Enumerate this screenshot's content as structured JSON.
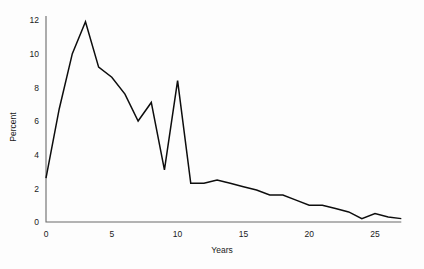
{
  "chart_data": {
    "type": "line",
    "title": "",
    "xlabel": "Years",
    "ylabel": "Percent",
    "xlim": [
      0,
      27
    ],
    "ylim": [
      0,
      12.6
    ],
    "grid": false,
    "legend": false,
    "legend_position": "none",
    "x_ticks": [
      0,
      5,
      10,
      15,
      20,
      25
    ],
    "x_tick_labels": [
      "0",
      "5",
      "10",
      "15",
      "20",
      "25"
    ],
    "y_ticks": [
      0,
      2,
      4,
      6,
      8,
      10,
      12
    ],
    "y_tick_labels": [
      "0",
      "2",
      "4",
      "6",
      "8",
      "10",
      "12"
    ],
    "line_color": "#0d0d0d",
    "axis_color": "#6b6b6b",
    "background_color": "#fdfdfd",
    "x": [
      0,
      1,
      2,
      3,
      4,
      5,
      6,
      7,
      8,
      9,
      10,
      11,
      12,
      13,
      14,
      15,
      16,
      17,
      18,
      19,
      20,
      21,
      22,
      23,
      24,
      25,
      26,
      27
    ],
    "values": [
      2.6,
      6.7,
      10.0,
      11.9,
      9.2,
      8.6,
      7.6,
      6.0,
      7.1,
      3.1,
      8.4,
      2.3,
      2.3,
      2.5,
      2.3,
      2.1,
      1.9,
      1.6,
      1.6,
      1.3,
      1.0,
      1.0,
      0.8,
      0.6,
      0.2,
      0.5,
      0.3,
      0.2
    ],
    "series": [
      {
        "name": "Percent",
        "values": [
          2.6,
          6.7,
          10.0,
          11.9,
          9.2,
          8.6,
          7.6,
          6.0,
          7.1,
          3.1,
          8.4,
          2.3,
          2.3,
          2.5,
          2.3,
          2.1,
          1.9,
          1.6,
          1.6,
          1.3,
          1.0,
          1.0,
          0.8,
          0.6,
          0.2,
          0.5,
          0.3,
          0.2
        ]
      }
    ],
    "annotations": [],
    "peak": {
      "x": 3,
      "y": 11.9
    },
    "secondary_peak": {
      "x": 10,
      "y": 8.4
    }
  }
}
